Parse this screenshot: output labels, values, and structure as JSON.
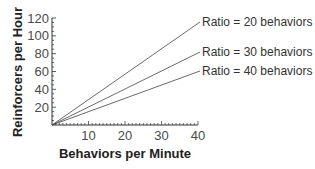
{
  "chart_data": {
    "type": "line",
    "title": "",
    "xlabel": "Behaviors per Minute",
    "ylabel": "Reinforcers per Hour",
    "xlim": [
      0,
      40
    ],
    "ylim": [
      0,
      120
    ],
    "x_ticks": [
      10,
      20,
      30,
      40
    ],
    "y_ticks": [
      20,
      40,
      60,
      80,
      100,
      120
    ],
    "grid": false,
    "legend_position": "inline-right",
    "series": [
      {
        "name": "Ratio = 20 behaviors",
        "x": [
          0,
          40
        ],
        "values": [
          0,
          120
        ]
      },
      {
        "name": "Ratio = 30 behaviors",
        "x": [
          0,
          40
        ],
        "values": [
          0,
          80
        ]
      },
      {
        "name": "Ratio = 40 behaviors",
        "x": [
          0,
          40
        ],
        "values": [
          0,
          60
        ]
      }
    ]
  }
}
